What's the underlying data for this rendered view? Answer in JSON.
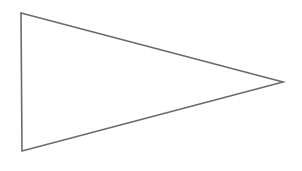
{
  "canvas": {
    "width": 302,
    "height": 171,
    "background_color": "#ffffff",
    "title": "Right-pointing triangle outline"
  },
  "figure": {
    "name": "triangle-outline",
    "kind": "line-drawing",
    "stroke_color": "#6b6b6b",
    "stroke_width": 1.6,
    "fill": "none",
    "points": [
      {
        "label": "top-left-vertex",
        "x": 21,
        "y": 13
      },
      {
        "label": "right-apex-vertex",
        "x": 283,
        "y": 82
      },
      {
        "label": "bottom-left-vertex",
        "x": 22,
        "y": 151
      }
    ],
    "points_attr": "21,13 283,82 22,151"
  },
  "labels": {
    "text_items": []
  }
}
